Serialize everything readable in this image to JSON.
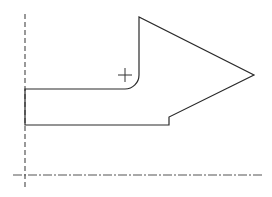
{
  "diagram": {
    "type": "cad-sketch",
    "canvas": {
      "width": 272,
      "height": 197,
      "background": "#ffffff"
    },
    "stroke_color": "#2a2a2a",
    "axes": {
      "horizontal": {
        "y": 175,
        "x1": 13,
        "x2": 263,
        "style": "dash-dot"
      },
      "vertical": {
        "x": 25,
        "y1": 14,
        "y2": 188,
        "style": "dashed"
      }
    },
    "shape": {
      "name": "arrow-profile",
      "points": {
        "bottom_left": [
          25,
          125
        ],
        "top_left": [
          25,
          89
        ],
        "fillet_start": [
          125,
          89
        ],
        "fillet_end": [
          139,
          75
        ],
        "arrow_top": [
          139,
          17
        ],
        "arrow_tip": [
          254,
          75
        ],
        "step_top": [
          169,
          117
        ],
        "step_bottom": [
          169,
          125
        ]
      },
      "fillet_radius": 14
    },
    "origin_marker": {
      "x": 125,
      "y": 75,
      "size": 7,
      "glyph": "crosshair"
    }
  }
}
